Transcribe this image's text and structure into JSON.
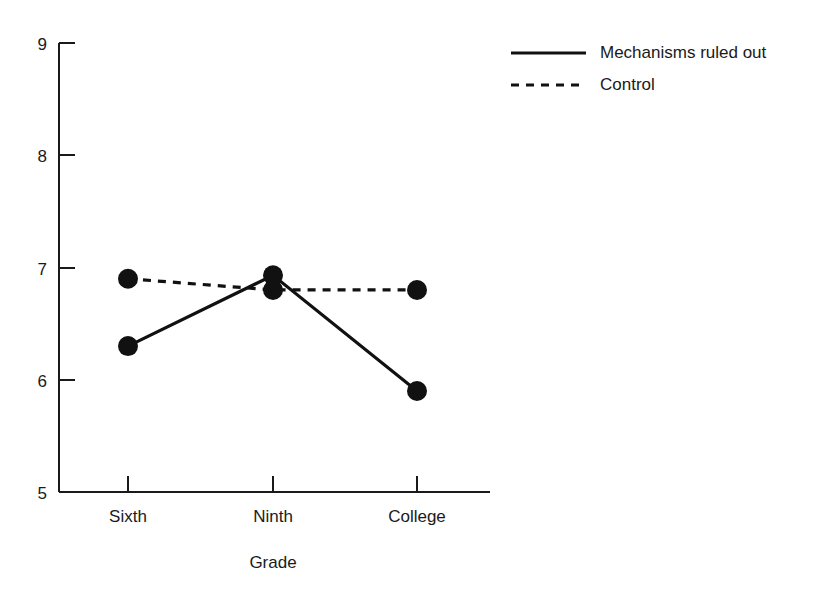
{
  "chart_data": {
    "type": "line",
    "title": "",
    "xlabel": "Grade",
    "ylabel": "",
    "categories": [
      "Sixth",
      "Ninth",
      "College"
    ],
    "ylim": [
      5,
      9
    ],
    "yticks": [
      5,
      6,
      7,
      8,
      9
    ],
    "ytick_labels": [
      "5",
      "6",
      "7",
      "8",
      "9"
    ],
    "grid": false,
    "legend_position": "top-right",
    "series": [
      {
        "name": "Mechanisms ruled out",
        "style": "solid",
        "marker": "filled-circle",
        "color": "#111111",
        "values": [
          6.3,
          6.93,
          5.9
        ]
      },
      {
        "name": "Control",
        "style": "dashed",
        "marker": "filled-circle",
        "color": "#111111",
        "values": [
          6.9,
          6.8,
          6.8
        ]
      }
    ]
  },
  "axes": {
    "y_tick_0": "5",
    "y_tick_1": "6",
    "y_tick_2": "7",
    "y_tick_3": "8",
    "y_tick_4": "9",
    "x_cat_0": "Sixth",
    "x_cat_1": "Ninth",
    "x_cat_2": "College",
    "x_title": "Grade"
  },
  "legend": {
    "entries": [
      {
        "label": "Mechanisms ruled out",
        "style": "solid"
      },
      {
        "label": "Control",
        "style": "dashed"
      }
    ],
    "entry_0_label": "Mechanisms ruled out",
    "entry_1_label": "Control"
  }
}
